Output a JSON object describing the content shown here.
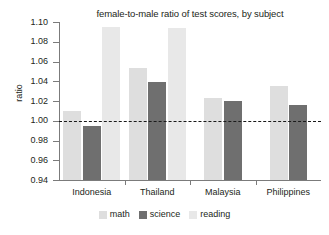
{
  "chart_data": {
    "type": "bar",
    "title": "female-to-male ratio of test scores, by subject",
    "xlabel": "",
    "ylabel": "ratio",
    "categories": [
      "Indonesia",
      "Thailand",
      "Malaysia",
      "Philippines"
    ],
    "series": [
      {
        "name": "math",
        "color": "#dedede",
        "values": [
          1.01,
          1.053,
          1.023,
          1.035
        ]
      },
      {
        "name": "science",
        "color": "#6f6f6f",
        "values": [
          0.995,
          1.039,
          1.02,
          1.016
        ]
      },
      {
        "name": "reading",
        "color": "#e8e8e8",
        "values": [
          1.095,
          1.094,
          null,
          null
        ]
      }
    ],
    "ylim": [
      0.94,
      1.1
    ],
    "yticks": [
      "1.10",
      "1.08",
      "1.06",
      "1.04",
      "1.02",
      "1.00",
      "0.98",
      "0.96",
      "0.94"
    ],
    "ytick_values": [
      1.1,
      1.08,
      1.06,
      1.04,
      1.02,
      1.0,
      0.98,
      0.96,
      0.94
    ],
    "grid": false,
    "reference_line": {
      "value": 1.0,
      "style": "dashed",
      "color": "#1a1a1a"
    },
    "legend_position": "bottom",
    "legend": [
      "math",
      "science",
      "reading"
    ]
  }
}
